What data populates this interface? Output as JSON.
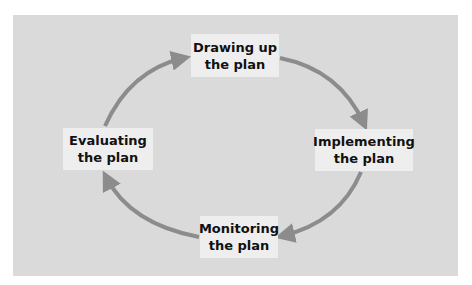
{
  "diagram": {
    "type": "cycle",
    "background_color": "#dadada",
    "node_color": "#eeeeee",
    "arrow_color": "#8c8c8c",
    "nodes": [
      {
        "id": "drawing",
        "line1": "Drawing up",
        "line2": "the plan"
      },
      {
        "id": "implementing",
        "line1": "Implementing",
        "line2": "the plan"
      },
      {
        "id": "monitoring",
        "line1": "Monitoring",
        "line2": "the plan"
      },
      {
        "id": "evaluating",
        "line1": "Evaluating",
        "line2": "the plan"
      }
    ],
    "edges": [
      {
        "from": "drawing",
        "to": "implementing"
      },
      {
        "from": "implementing",
        "to": "monitoring"
      },
      {
        "from": "monitoring",
        "to": "evaluating"
      },
      {
        "from": "evaluating",
        "to": "drawing"
      }
    ]
  }
}
